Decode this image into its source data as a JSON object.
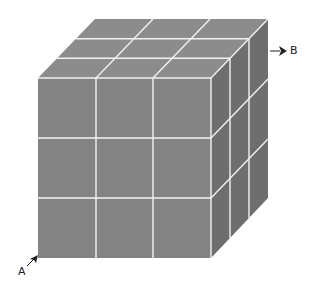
{
  "diagram": {
    "type": "3x3x3 cube",
    "grid": 3,
    "colors": {
      "front": "#838383",
      "top": "#8c8c8c",
      "side": "#6e6e6e",
      "gridline": "#f2f2f2"
    },
    "labels": {
      "a": "A",
      "b": "B"
    }
  }
}
